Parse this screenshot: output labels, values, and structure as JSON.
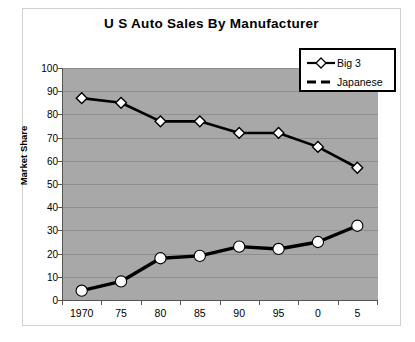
{
  "chart_data": {
    "type": "line",
    "title": "U S Auto Sales By Manufacturer",
    "xlabel": "",
    "ylabel": "Market Share",
    "categories": [
      "1970",
      "75",
      "80",
      "85",
      "90",
      "95",
      "0",
      "5"
    ],
    "ylim": [
      0,
      100
    ],
    "ytick_labels": [
      "0",
      "10",
      "20",
      "30",
      "40",
      "50",
      "60",
      "70",
      "80",
      "90",
      "100"
    ],
    "ytick_values": [
      0,
      10,
      20,
      30,
      40,
      50,
      60,
      70,
      80,
      90,
      100
    ],
    "grid": true,
    "legend_position": "top-right",
    "plot_background": "#a8a8a8",
    "series": [
      {
        "name": "Big 3",
        "marker": "diamond",
        "marker_fill": "#ffffff",
        "line_style": "solid",
        "color": "#000000",
        "values": [
          87,
          85,
          77,
          77,
          72,
          72,
          66,
          57
        ]
      },
      {
        "name": "Japanese",
        "marker": "circle",
        "marker_fill": "#ffffff",
        "line_style": "dashed",
        "color": "#000000",
        "values": [
          4,
          8,
          18,
          19,
          23,
          22,
          25,
          32
        ]
      }
    ]
  },
  "legend": {
    "items": [
      {
        "label": "Big 3"
      },
      {
        "label": "Japanese"
      }
    ]
  }
}
